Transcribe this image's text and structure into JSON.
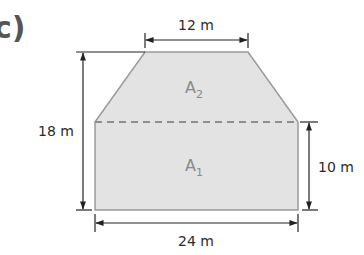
{
  "part_label": "c)",
  "shape": {
    "fill_color": "#e3e3e3",
    "outline_color": "#9a9a9a",
    "divider_color": "#8e8e8e",
    "regions": [
      {
        "id": "A1",
        "label": "A",
        "subscript": "1"
      },
      {
        "id": "A2",
        "label": "A",
        "subscript": "2"
      }
    ]
  },
  "dimensions": {
    "top_width": "12 m",
    "total_height": "18 m",
    "rectangle_height": "10 m",
    "bottom_width": "24 m"
  }
}
